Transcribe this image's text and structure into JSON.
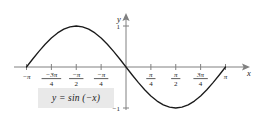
{
  "chart_data": {
    "type": "line",
    "title": "",
    "equation_label": "y = sin (−x)",
    "xlabel": "x",
    "ylabel": "y",
    "xlim": [
      -3.14159,
      3.14159
    ],
    "ylim": [
      -1.3,
      1.3
    ],
    "grid": false,
    "legend": "none",
    "x_tick_labels": [
      {
        "value": -3.14159,
        "text": "−π",
        "kind": "plain"
      },
      {
        "value": -2.35619,
        "text": "−3π/4",
        "kind": "fraction",
        "numerator": "−3π",
        "denominator": "4"
      },
      {
        "value": -1.5708,
        "text": "−π/2",
        "kind": "fraction",
        "numerator": "−π",
        "denominator": "2"
      },
      {
        "value": -0.7854,
        "text": "−π/4",
        "kind": "fraction",
        "numerator": "−π",
        "denominator": "4"
      },
      {
        "value": 0.7854,
        "text": "π/4",
        "kind": "fraction",
        "numerator": "π",
        "denominator": "4"
      },
      {
        "value": 1.5708,
        "text": "π/2",
        "kind": "fraction",
        "numerator": "π",
        "denominator": "2"
      },
      {
        "value": 2.35619,
        "text": "3π/4",
        "kind": "fraction",
        "numerator": "3π",
        "denominator": "4"
      },
      {
        "value": 3.14159,
        "text": "π",
        "kind": "plain"
      }
    ],
    "y_tick_labels": [
      {
        "value": 1,
        "text": "1"
      },
      {
        "value": -1,
        "text": "−1"
      }
    ],
    "series": [
      {
        "name": "y = sin(−x)",
        "color": "#1a1a1a",
        "x": [
          -3.14159,
          -2.94524,
          -2.74889,
          -2.55254,
          -2.35619,
          -2.15984,
          -1.9635,
          -1.76715,
          -1.5708,
          -1.37445,
          -1.1781,
          -0.98175,
          -0.7854,
          -0.58905,
          -0.3927,
          -0.19635,
          0,
          0.19635,
          0.3927,
          0.58905,
          0.7854,
          0.98175,
          1.1781,
          1.37445,
          1.5708,
          1.76715,
          1.9635,
          2.15984,
          2.35619,
          2.55254,
          2.74889,
          2.94524,
          3.14159
        ],
        "y": [
          0,
          0.19509,
          0.38268,
          0.55557,
          0.70711,
          0.83147,
          0.92388,
          0.98079,
          1,
          0.98079,
          0.92388,
          0.83147,
          0.70711,
          0.55557,
          0.38268,
          0.19509,
          0,
          -0.19509,
          -0.38268,
          -0.55557,
          -0.70711,
          -0.83147,
          -0.92388,
          -0.98079,
          -1,
          -0.98079,
          -0.92388,
          -0.83147,
          -0.70711,
          -0.55557,
          -0.38268,
          -0.19509,
          0
        ]
      }
    ]
  },
  "colors": {
    "curve": "#1a1a1a",
    "axis": "#808080",
    "label_box_bg": "#e9e9e9",
    "text": "#1a1a1a",
    "background": "#ffffff"
  }
}
